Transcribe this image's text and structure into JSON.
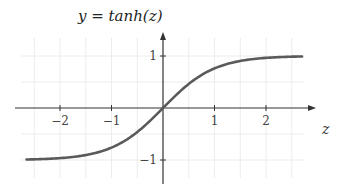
{
  "chart_data": {
    "type": "line",
    "title": "y = tanh(z)",
    "xlabel": "z",
    "ylabel": "",
    "function": "tanh",
    "xlim": [
      -2.65,
      2.7
    ],
    "ylim": [
      -1.45,
      1.45
    ],
    "x_ticks": [
      -2,
      -1,
      1,
      2
    ],
    "x_tick_labels": [
      "−2",
      "−1",
      "1",
      "2"
    ],
    "y_ticks": [
      1,
      -1
    ],
    "y_tick_labels": [
      "1",
      "−1"
    ],
    "grid": true,
    "grid_step": 0.5,
    "legend": null,
    "series": [
      {
        "name": "tanh(z)",
        "color": "#5a5a5a",
        "x": [
          -2.65,
          -2.5,
          -2.0,
          -1.5,
          -1.0,
          -0.5,
          0.0,
          0.5,
          1.0,
          1.5,
          2.0,
          2.5,
          2.7
        ],
        "values": [
          -0.99,
          -0.987,
          -0.964,
          -0.905,
          -0.762,
          -0.462,
          0.0,
          0.462,
          0.762,
          0.905,
          0.964,
          0.987,
          0.991
        ]
      }
    ]
  },
  "colors": {
    "axis": "#333333",
    "grid": "#ececec",
    "curve": "#5a5a5a"
  }
}
